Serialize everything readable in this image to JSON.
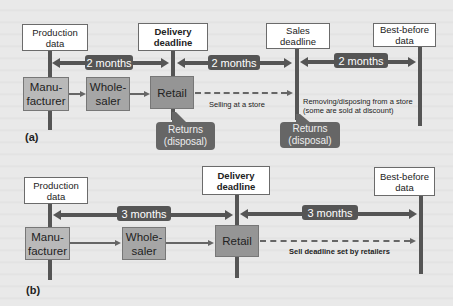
{
  "panel_a": {
    "label": "(a)",
    "milestones": [
      {
        "label": "Production data",
        "line1": "Production",
        "line2": "data",
        "bold": false
      },
      {
        "label": "Delivery deadline",
        "line1": "Delivery",
        "line2": "deadline",
        "bold": true
      },
      {
        "label": "Sales deadline",
        "line1": "Sales",
        "line2": "deadline",
        "bold": false
      },
      {
        "label": "Best-before data",
        "line1": "Best-before",
        "line2": "data",
        "bold": false
      }
    ],
    "intervals": [
      "2 months",
      "2 months",
      "2 months"
    ],
    "nodes": [
      {
        "line1": "Manu-",
        "line2": "facturer"
      },
      {
        "line1": "Whole-",
        "line2": "saler"
      },
      {
        "line1": "Retail",
        "line2": ""
      }
    ],
    "selling_note": "Selling at a store",
    "removing_note_line1": "Removing/disposing from a store",
    "removing_note_line2": "(some are sold at discount)",
    "returns": [
      {
        "line1": "Returns",
        "line2": "(disposal)"
      },
      {
        "line1": "Returns",
        "line2": "(disposal)"
      }
    ]
  },
  "panel_b": {
    "label": "(b)",
    "milestones": [
      {
        "label": "Production data",
        "line1": "Production",
        "line2": "data",
        "bold": false
      },
      {
        "label": "Delivery deadline",
        "line1": "Delivery",
        "line2": "deadline",
        "bold": true
      },
      {
        "label": "Best-before data",
        "line1": "Best-before",
        "line2": "data",
        "bold": false
      }
    ],
    "intervals": [
      "3 months",
      "3 months"
    ],
    "nodes": [
      {
        "line1": "Manu-",
        "line2": "facturer"
      },
      {
        "line1": "Whole-",
        "line2": "saler"
      },
      {
        "line1": "Retail",
        "line2": ""
      }
    ],
    "sell_note": "Sell deadline set by retailers"
  },
  "colors": {
    "background": "#e9e9e9",
    "bar": "#555555",
    "node_light": "#b9b9b9",
    "node_dark": "#959595",
    "returns": "#666666"
  }
}
